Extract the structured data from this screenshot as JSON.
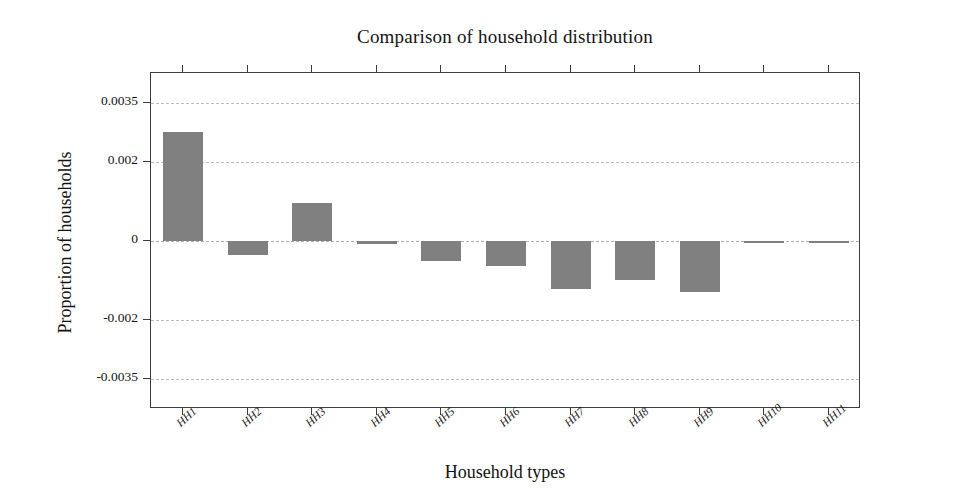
{
  "chart_data": {
    "type": "bar",
    "title": "Comparison of household distribution",
    "xlabel": "Household types",
    "ylabel": "Proportion of households",
    "categories": [
      "HH1",
      "HH2",
      "HH3",
      "HH4",
      "HH5",
      "HH6",
      "HH7",
      "HH8",
      "HH9",
      "HH10",
      "HH11"
    ],
    "values": [
      0.00275,
      -0.00035,
      0.00095,
      -8e-05,
      -0.0005,
      -0.00062,
      -0.00122,
      -0.00098,
      -0.00128,
      -2e-05,
      -2e-05
    ],
    "ytick_labels": [
      "0.0035",
      "0.002",
      "0",
      "-0.002",
      "-0.0035"
    ],
    "ytick_values": [
      0.0035,
      0.002,
      0,
      -0.002,
      -0.0035
    ],
    "ylim": [
      -0.00425,
      0.00425
    ],
    "grid": true,
    "legend": "none",
    "bar_color": "#808080",
    "frame_color": "#3d3d3d",
    "grid_color": "#bdbdbd",
    "background": "#ffffff"
  }
}
